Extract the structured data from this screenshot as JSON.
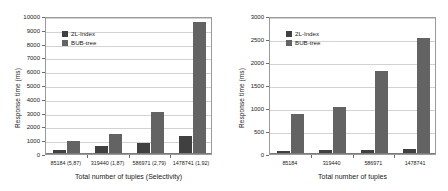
{
  "figure": {
    "panel_count": 2,
    "series_colors": {
      "2L-Index": "#404040",
      "BUB-tree": "#636363"
    }
  },
  "chart_data": [
    {
      "type": "bar",
      "title": "",
      "xlabel": "Total number of tuples (Selectivity)",
      "ylabel": "Response time (ms)",
      "categories": [
        "85184 (5,87)",
        "319440 (1,87)",
        "586971 (2,79)",
        "1478741 (1,92)"
      ],
      "series": [
        {
          "name": "2L-Index",
          "values": [
            250,
            500,
            700,
            1200
          ]
        },
        {
          "name": "BUB-tree",
          "values": [
            900,
            1400,
            2950,
            9500
          ]
        }
      ],
      "ylim": [
        0,
        10000
      ],
      "yticks": [
        0,
        1000,
        2000,
        3000,
        4000,
        5000,
        6000,
        7000,
        8000,
        9000,
        10000
      ],
      "ytick_labels": [
        "0",
        "1000",
        "2000",
        "3000",
        "4000",
        "5000",
        "6000",
        "7000",
        "8000",
        "9000",
        "10000"
      ],
      "grid": true,
      "legend_position": "upper-left",
      "legend": [
        "2L-Index",
        "BUB-tree"
      ]
    },
    {
      "type": "bar",
      "title": "",
      "xlabel": "Total number of tuples",
      "ylabel": "Response time (ms)",
      "categories": [
        "85184",
        "319440",
        "586971",
        "1478741"
      ],
      "series": [
        {
          "name": "2L-Index",
          "values": [
            45,
            60,
            75,
            80
          ]
        },
        {
          "name": "BUB-tree",
          "values": [
            855,
            995,
            1790,
            2490
          ]
        }
      ],
      "ylim": [
        0,
        3000
      ],
      "yticks": [
        0,
        500,
        1000,
        1500,
        2000,
        2500,
        3000
      ],
      "ytick_labels": [
        "0",
        "500",
        "1000",
        "1500",
        "2000",
        "2500",
        "3000"
      ],
      "grid": true,
      "legend_position": "upper-left",
      "legend": [
        "2L-Index",
        "BUB-tree"
      ]
    }
  ]
}
